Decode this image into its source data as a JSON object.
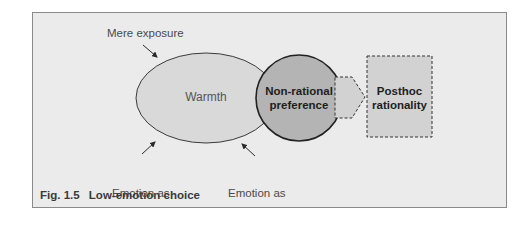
{
  "diagram": {
    "nodes": {
      "warmth": {
        "label": "Warmth",
        "shape": "ellipse",
        "fill": "#d9d9d9"
      },
      "non_rational_preference": {
        "line1": "Non-rational",
        "line2": "preference",
        "shape": "circle",
        "fill": "#b4b4b4"
      },
      "posthoc_rationality": {
        "line1": "Posthoc",
        "line2": "rationality",
        "shape": "dashed-rectangle",
        "fill": "#d2d2d2"
      }
    },
    "influences": {
      "mere_exposure": {
        "label": "Mere exposure"
      },
      "emotion_as_signal": {
        "line1": "Emotion as",
        "line2": "signal"
      },
      "emotion_as_information": {
        "line1": "Emotion as",
        "line2": "information"
      }
    },
    "connector": {
      "type": "dashed-arrow",
      "from": "Non-rational preference",
      "to": "Posthoc rationality"
    }
  },
  "caption": {
    "number": "Fig. 1.5",
    "title": "Low-emotion choice"
  },
  "colors": {
    "panel_bg": "#ebebeb",
    "panel_border": "#8a8a8a",
    "ellipse_fill": "#d9d9d9",
    "circle_fill": "#b4b4b4",
    "box_fill": "#d2d2d2",
    "stroke": "#2a2a2a"
  }
}
